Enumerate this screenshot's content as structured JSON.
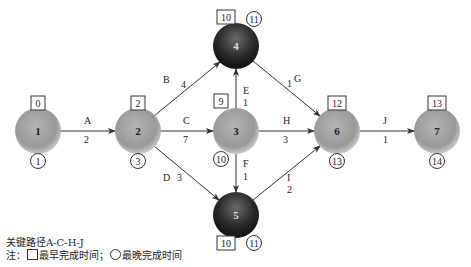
{
  "diagram": {
    "type": "network-diagram",
    "nodes": [
      {
        "id": "1",
        "label": "1",
        "earliest": "0",
        "latest": "1",
        "style": "light"
      },
      {
        "id": "2",
        "label": "2",
        "earliest": "2",
        "latest": "3",
        "style": "light"
      },
      {
        "id": "3",
        "label": "3",
        "earliest": "9",
        "latest": "10",
        "style": "light"
      },
      {
        "id": "4",
        "label": "4",
        "earliest": "10",
        "latest": "11",
        "style": "dark"
      },
      {
        "id": "5",
        "label": "5",
        "earliest": "10",
        "latest": "11",
        "style": "dark"
      },
      {
        "id": "6",
        "label": "6",
        "earliest": "12",
        "latest": "13",
        "style": "light"
      },
      {
        "id": "7",
        "label": "7",
        "earliest": "13",
        "latest": "14",
        "style": "light"
      }
    ],
    "edges": [
      {
        "from": "1",
        "to": "2",
        "activity": "A",
        "duration": "2"
      },
      {
        "from": "2",
        "to": "4",
        "activity": "B",
        "duration": "4"
      },
      {
        "from": "2",
        "to": "3",
        "activity": "C",
        "duration": "7"
      },
      {
        "from": "2",
        "to": "5",
        "activity": "D",
        "duration": "3"
      },
      {
        "from": "3",
        "to": "4",
        "activity": "E",
        "duration": "1"
      },
      {
        "from": "3",
        "to": "5",
        "activity": "F",
        "duration": "1"
      },
      {
        "from": "4",
        "to": "6",
        "activity": "G",
        "duration": "1"
      },
      {
        "from": "3",
        "to": "6",
        "activity": "H",
        "duration": "3"
      },
      {
        "from": "5",
        "to": "6",
        "activity": "I",
        "duration": "2"
      },
      {
        "from": "6",
        "to": "7",
        "activity": "J",
        "duration": "1"
      }
    ]
  },
  "notes": {
    "critical_path": "关键路径A-C-H-J",
    "legend_prefix": "注：",
    "legend_square": "最早完成时间；",
    "legend_circle": "最晚完成时间"
  },
  "colors": {
    "light_node": "#9a9a9a",
    "dark_node": "#2a2a2a",
    "edge": "#333333"
  }
}
